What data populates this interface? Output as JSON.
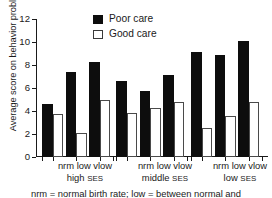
{
  "chart_data": {
    "type": "bar",
    "title": "",
    "xlabel": "",
    "ylabel": "Average score on behavior problems",
    "ylim": [
      0,
      12
    ],
    "yticks": [
      0,
      2,
      4,
      6,
      8,
      10,
      12
    ],
    "grid": false,
    "legend_position": "top-center",
    "categories": [
      "nrm",
      "low",
      "vlow",
      "nrm",
      "low",
      "vlow",
      "nrm",
      "low",
      "vlow"
    ],
    "groups": [
      {
        "label_line1": "nrm low vlow",
        "label_line2_text": "high ",
        "label_line2_smallcaps": "SES",
        "subcategories": [
          "nrm",
          "low",
          "vlow"
        ]
      },
      {
        "label_line1": "nrm low vlow",
        "label_line2_text": "middle ",
        "label_line2_smallcaps": "SES",
        "subcategories": [
          "nrm",
          "low",
          "vlow"
        ]
      },
      {
        "label_line1": "nrm low vlow",
        "label_line2_text": "low ",
        "label_line2_smallcaps": "SES",
        "subcategories": [
          "nrm",
          "low",
          "vlow"
        ]
      }
    ],
    "series": [
      {
        "name": "Poor care",
        "color": "#0d0d0d",
        "values": [
          4.6,
          7.4,
          8.3,
          6.6,
          5.7,
          7.1,
          9.15,
          8.9,
          10.1
        ]
      },
      {
        "name": "Good care",
        "color": "#ffffff",
        "values": [
          3.7,
          2.1,
          5.0,
          3.8,
          4.3,
          4.75,
          2.5,
          3.6,
          4.75
        ]
      }
    ]
  },
  "legend": {
    "items": [
      {
        "label": "Poor care",
        "swatch": "filled-black-square"
      },
      {
        "label": "Good care",
        "swatch": "outlined-white-square"
      }
    ]
  },
  "caption": {
    "text": "nrm = normal birth rate; low = between normal and"
  }
}
